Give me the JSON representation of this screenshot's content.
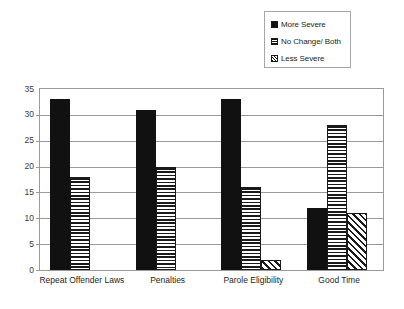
{
  "chart_data": {
    "type": "bar",
    "title": "",
    "subtitle": "",
    "xlabel": "",
    "ylabel": "",
    "categories": [
      "Repeat Offender Laws",
      "Penalties",
      "Parole Eligibility",
      "Good Time"
    ],
    "series": [
      {
        "name": "More Severe",
        "pattern": "solid",
        "values": [
          33,
          31,
          33,
          12
        ]
      },
      {
        "name": "No Change/ Both",
        "pattern": "horizontal-stripe",
        "values": [
          18,
          20,
          16,
          28
        ]
      },
      {
        "name": "Less Severe",
        "pattern": "diagonal-hatch",
        "values": [
          0,
          0,
          2,
          11
        ]
      }
    ],
    "ylim": [
      0,
      35
    ],
    "ytick_step": 5,
    "yticks": [
      0,
      5,
      10,
      15,
      20,
      25,
      30,
      35
    ],
    "ytick_labels": [
      "0",
      "5",
      "10",
      "15",
      "20",
      "25",
      "30",
      "35"
    ],
    "grid": true,
    "grid_axis": "y",
    "legend_position": "top-right",
    "legend_border": true,
    "colors": {
      "series_fill": "#111111",
      "gridline": "#9a9a9a",
      "axis_border": "#9a9a9a",
      "legend_border": "#a6a6a6",
      "text": "#231f20",
      "tick_text": "#3a3a3a",
      "background": "#ffffff"
    }
  },
  "legend": {
    "items": [
      {
        "label": "More Severe",
        "swatch": "legend-swatch-solid-icon"
      },
      {
        "label": "No Change/ Both",
        "swatch": "legend-swatch-hstripe-icon"
      },
      {
        "label": "Less Severe",
        "swatch": "legend-swatch-diagonal-icon"
      }
    ]
  }
}
